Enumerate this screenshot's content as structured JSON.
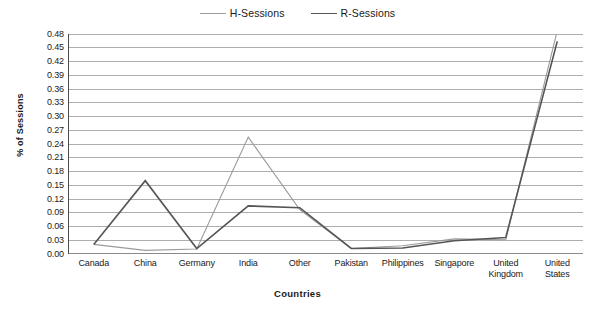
{
  "chart_data": {
    "type": "line",
    "title": "",
    "xlabel": "Countries",
    "ylabel": "% of Sessions",
    "categories": [
      "Canada",
      "China",
      "Germany",
      "India",
      "Other",
      "Pakistan",
      "Philippines",
      "Singapore",
      "United\nKingdom",
      "United\nStates"
    ],
    "yticks": [
      "0.48",
      "0.45",
      "0.42",
      "0.39",
      "0.36",
      "0.33",
      "0.30",
      "0.27",
      "0.24",
      "0.21",
      "0.18",
      "0.15",
      "0.12",
      "0.09",
      "0.06",
      "0.03",
      "0.00"
    ],
    "ylim": [
      0.0,
      0.48
    ],
    "ytick_step": 0.03,
    "grid": "horizontal",
    "legend_position": "top-center",
    "series": [
      {
        "name": "H-Sessions",
        "color": "#9b9b9b",
        "values": [
          0.021,
          0.008,
          0.011,
          0.255,
          0.097,
          0.012,
          0.018,
          0.033,
          0.031,
          0.487
        ]
      },
      {
        "name": "R-Sessions",
        "color": "#555555",
        "values": [
          0.021,
          0.16,
          0.012,
          0.105,
          0.101,
          0.012,
          0.013,
          0.029,
          0.036,
          0.464
        ]
      }
    ]
  },
  "legend": {
    "entries": [
      {
        "label": "H-Sessions"
      },
      {
        "label": "R-Sessions"
      }
    ]
  },
  "axes": {
    "y_title": "% of Sessions",
    "x_title": "Countries"
  },
  "colors": {
    "series_h": "#9b9b9b",
    "series_r": "#555555",
    "grid": "#8a8a8a",
    "axis": "#4d4d4d",
    "text": "#1a1a1a",
    "background": "#ffffff"
  }
}
